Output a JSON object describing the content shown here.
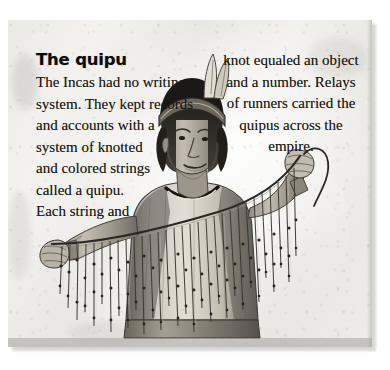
{
  "article": {
    "heading": "The quipu",
    "left_column_lines": [
      "The Incas had no writing",
      "system. They kept records",
      "and accounts with a",
      "system of knotted",
      "and colored strings",
      "called a quipu.",
      "Each string and"
    ],
    "right_column_lines": [
      "knot equaled an object",
      "and a number. Relays",
      "of runners carried the",
      "quipus across the",
      "empire."
    ],
    "full_text": "The quipu. The Incas had no writing system. They kept records and accounts with a system of knotted and colored strings called a quipu. Each string and knot equaled an object and a number. Relays of runners carried the quipus across the empire."
  },
  "illustration": {
    "caption": "Inca man holding a quipu with knotted hanging strings",
    "subject": "inca-man-with-quipu",
    "elements": [
      "feathered-headdress",
      "headband",
      "tunic",
      "quipu-main-cord",
      "quipu-pendant-strings",
      "knots"
    ]
  },
  "colors": {
    "paper": "#efedea",
    "ink": "#14130f",
    "shadow": "#b9b8b5",
    "figure_dark": "#2c2a26",
    "figure_mid": "#807c74",
    "figure_light": "#d8d4cc"
  }
}
